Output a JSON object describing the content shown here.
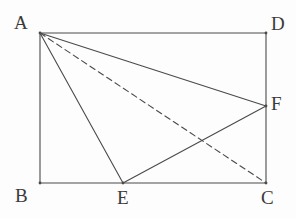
{
  "figure": {
    "type": "geometry-diagram",
    "canvas": {
      "width": 296,
      "height": 219
    },
    "background_color": "#fdfdfd",
    "stroke_color": "#4a4a4a",
    "stroke_width": 1.1,
    "dash_pattern": "6 4",
    "points": [
      {
        "id": "A",
        "label": "A",
        "x": 40,
        "y": 33,
        "label_x": 14,
        "label_y": 13
      },
      {
        "id": "D",
        "label": "D",
        "x": 266,
        "y": 33,
        "label_x": 271,
        "label_y": 14
      },
      {
        "id": "B",
        "label": "B",
        "x": 40,
        "y": 183,
        "label_x": 15,
        "label_y": 186
      },
      {
        "id": "C",
        "label": "C",
        "x": 266,
        "y": 183,
        "label_x": 261,
        "label_y": 188
      },
      {
        "id": "E",
        "label": "E",
        "x": 123,
        "y": 183,
        "label_x": 117,
        "label_y": 188
      },
      {
        "id": "F",
        "label": "F",
        "x": 266,
        "y": 106,
        "label_x": 271,
        "label_y": 94
      }
    ],
    "segments": [
      {
        "id": "AD",
        "from": "A",
        "to": "D",
        "style": "solid",
        "name": "rectangle-top-edge"
      },
      {
        "id": "DC",
        "from": "D",
        "to": "C",
        "style": "solid",
        "name": "rectangle-right-edge"
      },
      {
        "id": "BC",
        "from": "B",
        "to": "C",
        "style": "solid",
        "name": "rectangle-bottom-edge"
      },
      {
        "id": "AB",
        "from": "A",
        "to": "B",
        "style": "solid",
        "name": "rectangle-left-edge"
      },
      {
        "id": "AF",
        "from": "A",
        "to": "F",
        "style": "solid",
        "name": "segment-af"
      },
      {
        "id": "AE",
        "from": "A",
        "to": "E",
        "style": "solid",
        "name": "segment-ae"
      },
      {
        "id": "EF",
        "from": "E",
        "to": "F",
        "style": "solid",
        "name": "segment-ef"
      },
      {
        "id": "AC",
        "from": "A",
        "to": "C",
        "style": "dashed",
        "name": "segment-ac-dashed"
      }
    ]
  }
}
